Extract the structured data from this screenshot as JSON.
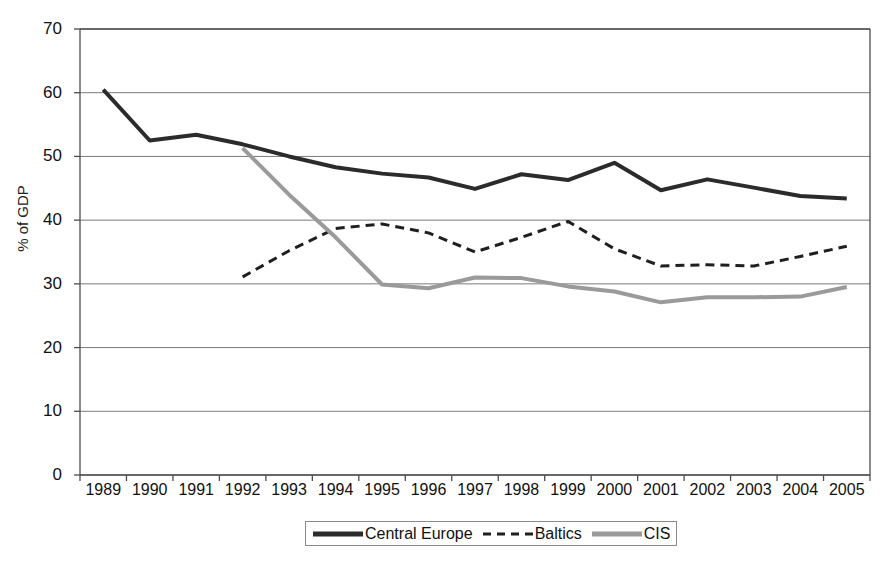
{
  "chart_data": {
    "type": "line",
    "title": "",
    "subtitle": "",
    "xlabel": "",
    "ylabel": "% of GDP",
    "xlim": [
      1989,
      2005
    ],
    "ylim": [
      0,
      70
    ],
    "ytick_step": 10,
    "grid": "horizontal",
    "legend_position": "bottom",
    "x": [
      1989,
      1990,
      1991,
      1992,
      1993,
      1994,
      1995,
      1996,
      1997,
      1998,
      1999,
      2000,
      2001,
      2002,
      2003,
      2004,
      2005
    ],
    "xticklabels": [
      "1989",
      "1990",
      "1991",
      "1992",
      "1993",
      "1994",
      "1995",
      "1996",
      "1997",
      "1998",
      "1999",
      "2000",
      "2001",
      "2002",
      "2003",
      "2004",
      "2005"
    ],
    "yticklabels": [
      "0",
      "10",
      "20",
      "30",
      "40",
      "50",
      "60",
      "70"
    ],
    "yticks": [
      0,
      10,
      20,
      30,
      40,
      50,
      60,
      70
    ],
    "series": [
      {
        "name": "Central Europe",
        "style": "solid",
        "color": "#2b2b2b",
        "width": 4,
        "x": [
          1989,
          1990,
          1991,
          1992,
          1993,
          1994,
          1995,
          1996,
          1997,
          1998,
          1999,
          2000,
          2001,
          2002,
          2003,
          2004,
          2005
        ],
        "values": [
          60.5,
          52.5,
          53.4,
          51.9,
          50.0,
          48.3,
          47.3,
          46.7,
          44.9,
          47.2,
          46.3,
          49.0,
          44.7,
          46.4,
          45.1,
          43.8,
          43.4
        ]
      },
      {
        "name": "Baltics",
        "style": "dashed",
        "color": "#1f1f1f",
        "width": 3,
        "x": [
          1992,
          1993,
          1994,
          1995,
          1996,
          1997,
          1998,
          1999,
          2000,
          2001,
          2002,
          2003,
          2004,
          2005
        ],
        "values": [
          31.1,
          35.2,
          38.7,
          39.4,
          38.0,
          35.0,
          37.3,
          39.8,
          35.5,
          32.8,
          33.0,
          32.8,
          34.3,
          35.9
        ]
      },
      {
        "name": "CIS",
        "style": "solid",
        "color": "#9a9a9a",
        "width": 4,
        "x": [
          1992,
          1993,
          1994,
          1995,
          1996,
          1997,
          1998,
          1999,
          2000,
          2001,
          2002,
          2003,
          2004,
          2005
        ],
        "values": [
          51.3,
          44.0,
          37.3,
          29.9,
          29.3,
          31.0,
          30.9,
          29.6,
          28.8,
          27.1,
          27.9,
          27.9,
          28.0,
          29.5
        ]
      }
    ]
  },
  "legend": {
    "items": [
      {
        "label": "Central Europe",
        "swatch": "solid-black-line-swatch"
      },
      {
        "label": "Baltics",
        "swatch": "dashed-black-line-swatch"
      },
      {
        "label": "CIS",
        "swatch": "solid-gray-line-swatch"
      }
    ]
  },
  "colors": {
    "central_europe": "#2b2b2b",
    "baltics": "#1f1f1f",
    "cis": "#9a9a9a",
    "axis": "#4d4d4d",
    "grid": "#7a7a7a",
    "background": "#ffffff"
  }
}
